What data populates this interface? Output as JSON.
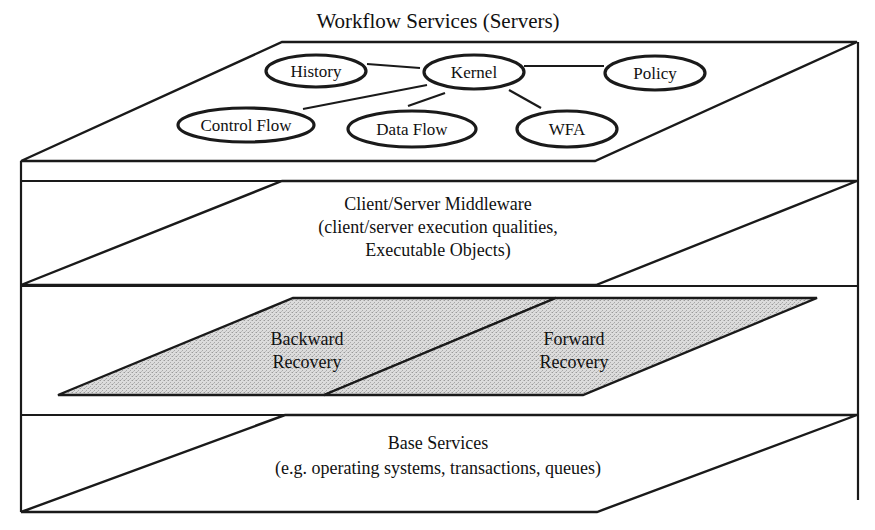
{
  "title": "Workflow Services (Servers)",
  "top_layer": {
    "nodes": [
      {
        "id": "history",
        "label": "History"
      },
      {
        "id": "kernel",
        "label": "Kernel"
      },
      {
        "id": "policy",
        "label": "Policy"
      },
      {
        "id": "control_flow",
        "label": "Control Flow"
      },
      {
        "id": "data_flow",
        "label": "Data Flow"
      },
      {
        "id": "wfa",
        "label": "WFA"
      }
    ],
    "edges": [
      [
        "history",
        "kernel"
      ],
      [
        "kernel",
        "policy"
      ],
      [
        "kernel",
        "control_flow"
      ],
      [
        "kernel",
        "data_flow"
      ],
      [
        "kernel",
        "wfa"
      ]
    ]
  },
  "middleware_layer": {
    "line1": "Client/Server Middleware",
    "line2": "(client/server execution qualities,",
    "line3": "Executable Objects)"
  },
  "recovery_layer": {
    "backward": {
      "line1": "Backward",
      "line2": "Recovery"
    },
    "forward": {
      "line1": "Forward",
      "line2": "Recovery"
    },
    "fill_color": "#d4d4d4"
  },
  "base_layer": {
    "line1": "Base Services",
    "line2": "(e.g. operating systems, transactions, queues)"
  }
}
